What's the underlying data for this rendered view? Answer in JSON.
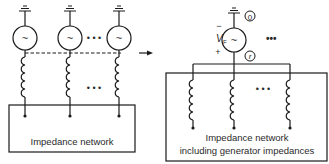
{
  "left_diagram": {
    "box_label": "Impedance network",
    "generators": [
      {
        "symbol": "~"
      },
      {
        "symbol": "~"
      },
      {
        "symbol": "~"
      }
    ],
    "ellipsis_generators": "• • •",
    "ellipsis_inductors": "• • •"
  },
  "arrow": {
    "direction": "right"
  },
  "right_diagram": {
    "generator": {
      "symbol": "~"
    },
    "source_label": "V",
    "source_subscript": "F",
    "minus_sign": "−",
    "plus_sign": "+",
    "node_reference": "0",
    "node_fault": "r",
    "ellipsis_generator": "•••",
    "ellipsis_inductors": "• • •",
    "box_label_line1": "Impedance network",
    "box_label_line2": "including generator impedances"
  },
  "colors": {
    "line": "#1a1a1a",
    "text": "#2a2a2a",
    "background": "#ffffff"
  }
}
